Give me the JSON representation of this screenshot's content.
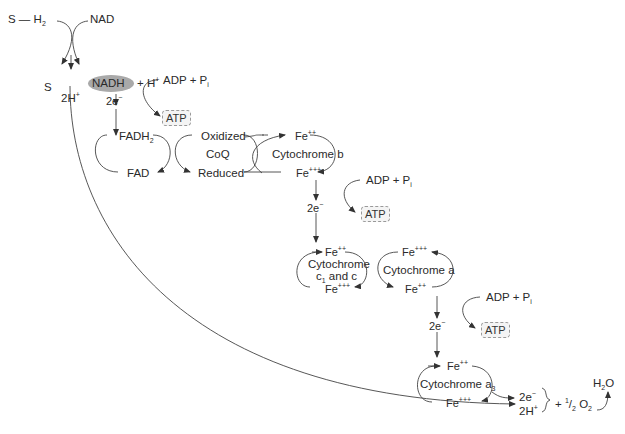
{
  "substrate": {
    "reduced": "S — H",
    "reduced_sub": "2",
    "oxidized": "S"
  },
  "nad": {
    "label": "NAD",
    "nadh": "NADH",
    "plus_h": "+ H",
    "plus_h_sup": "+"
  },
  "protons_top": {
    "label": "2H",
    "sup": "+"
  },
  "electrons": {
    "label": "2e",
    "sup": "−"
  },
  "adp": {
    "label": "ADP + P",
    "sub": "i"
  },
  "atp": {
    "label": "ATP"
  },
  "flavoprotein": {
    "reduced": "FADH",
    "reduced_sub": "2",
    "oxidized": "FAD"
  },
  "coq": {
    "name": "CoQ",
    "oxidized": "Oxidized",
    "reduced": "Reduced"
  },
  "iron": {
    "fe2": "Fe",
    "fe2_sup": "++",
    "fe3": "Fe",
    "fe3_sup": "+++"
  },
  "cyt_b": {
    "name": "Cytochrome b"
  },
  "cyt_c": {
    "line1": "Cytochrome",
    "line2_pre": "c",
    "line2_sub": "1",
    "line2_post": " and c"
  },
  "cyt_a": {
    "name": "Cytochrome a"
  },
  "cyt_a3": {
    "name": "Cytochrome a",
    "sub": "3"
  },
  "final": {
    "electrons": "2e",
    "electrons_sup": "−",
    "protons": "2H",
    "protons_sup": "+",
    "oxygen_pre": "+ ",
    "oxygen_frac_num": "1",
    "oxygen_frac_den": "2",
    "oxygen": " O",
    "oxygen_sub": "2",
    "water": "H",
    "water_sub": "2",
    "water_post": "O"
  },
  "colors": {
    "line": "#333333",
    "nadh_fill": "#a9a9a9",
    "atp_fill": "#f4f4f4"
  }
}
